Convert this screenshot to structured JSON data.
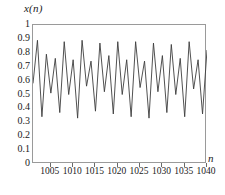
{
  "chart_data": {
    "type": "line",
    "title": "",
    "subtitle": "",
    "xlabel": "n",
    "ylabel": "x(n)",
    "ylim": [
      0,
      1
    ],
    "xlim": [
      1001,
      1040
    ],
    "grid": false,
    "legend": null,
    "line_color": "#3d3d3d",
    "frame_color": "#9a9a9a",
    "background": "#ffffff",
    "y_ticks": [
      "0",
      "0.1",
      "0.2",
      "0.3",
      "0.4",
      "0.5",
      "0.6",
      "0.7",
      "0.8",
      "0.9",
      "1"
    ],
    "y_tick_values": [
      0,
      0.1,
      0.2,
      0.3,
      0.4,
      0.5,
      0.6,
      0.7,
      0.8,
      0.9,
      1
    ],
    "x_ticks": [
      "1005",
      "1010",
      "1015",
      "1020",
      "1025",
      "1030",
      "1035",
      "1040"
    ],
    "x_tick_values": [
      1005,
      1010,
      1015,
      1020,
      1025,
      1030,
      1035,
      1040
    ],
    "series": [
      {
        "name": "x(n)",
        "x": [
          1001,
          1002,
          1003,
          1004,
          1005,
          1006,
          1007,
          1008,
          1009,
          1010,
          1011,
          1012,
          1013,
          1014,
          1015,
          1016,
          1017,
          1018,
          1019,
          1020,
          1021,
          1022,
          1023,
          1024,
          1025,
          1026,
          1027,
          1028,
          1029,
          1030,
          1031,
          1032,
          1033,
          1034,
          1035,
          1036,
          1037,
          1038,
          1039,
          1040
        ],
        "values": [
          0.58,
          0.89,
          0.34,
          0.79,
          0.51,
          0.76,
          0.37,
          0.88,
          0.5,
          0.75,
          0.33,
          0.89,
          0.56,
          0.74,
          0.38,
          0.87,
          0.52,
          0.78,
          0.36,
          0.88,
          0.5,
          0.75,
          0.34,
          0.88,
          0.55,
          0.74,
          0.33,
          0.87,
          0.52,
          0.78,
          0.37,
          0.86,
          0.5,
          0.76,
          0.34,
          0.88,
          0.54,
          0.75,
          0.36,
          0.82
        ]
      }
    ]
  },
  "axes": {
    "y_axis_label": "x(n)",
    "x_axis_label": "n"
  }
}
